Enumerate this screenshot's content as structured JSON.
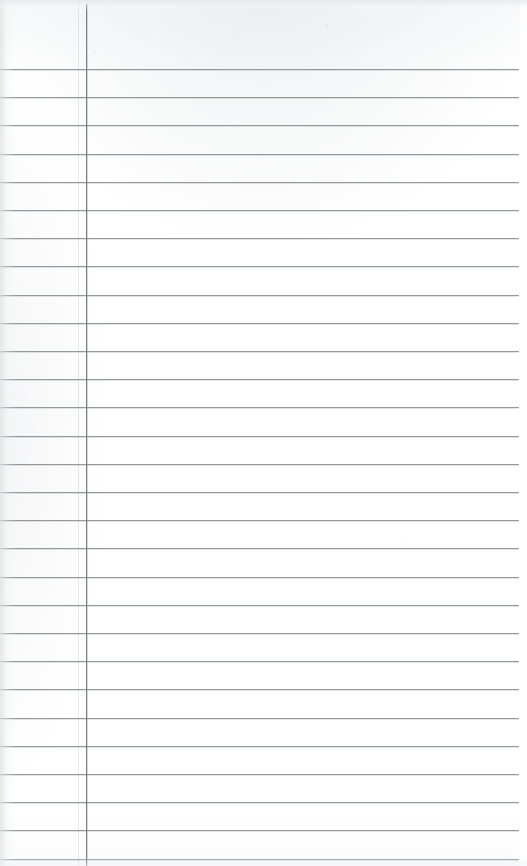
{
  "document": {
    "kind": "blank-ruled-notepad-page",
    "title": "Blank Ruled Notepad Page",
    "description": "Scanned blank lined notepad sheet with no written content",
    "page_width": 527,
    "page_height": 866,
    "text_content": "",
    "visible_text_items": []
  },
  "paper": {
    "background_color": "#ffffff",
    "top_edge_tint_color": "#e5e7ea",
    "left_edge_tint_color": "#dee0e4",
    "bottom_edge_tint_color": "#f0f1f3"
  },
  "ruling": {
    "rule_color": "#8d9095",
    "rule_thickness_px": 1,
    "first_rule_y": 69,
    "rule_spacing_px": 28.2,
    "rule_count": 29,
    "rule_left_x": 0,
    "rule_right_x": 519,
    "rule_y_positions": [
      69,
      97.2,
      125.4,
      153.6,
      181.8,
      210,
      238.2,
      266.4,
      294.6,
      322.8,
      351,
      379.2,
      407.4,
      435.6,
      463.8,
      492,
      520.2,
      548.4,
      576.6,
      604.8,
      633,
      661.2,
      689.4,
      717.6,
      745.8,
      774,
      802.2,
      830.4,
      858.6
    ]
  },
  "margin_rule": {
    "name": "vertical-margin-line",
    "color": "#76797e",
    "thickness_px": 1,
    "x": 86,
    "top_y": 4,
    "bottom_y": 866
  }
}
